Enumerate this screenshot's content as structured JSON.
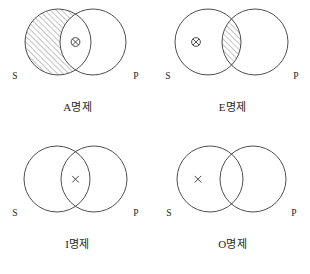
{
  "figure": {
    "title": "",
    "type": "venn-diagram-set",
    "panel_count": 4
  },
  "symbols": {
    "circled_x": "circled-x",
    "plain_x": "x",
    "hatch": "diagonal-hatch"
  },
  "panels": [
    {
      "id": "A",
      "caption": "A명제",
      "left_label": "S",
      "right_label": "P",
      "shaded_region": "s-only",
      "shading": "diagonal-hatch",
      "mark": "circled-x",
      "mark_region": "intersection"
    },
    {
      "id": "E",
      "caption": "E명제",
      "left_label": "S",
      "right_label": "P",
      "shaded_region": "intersection",
      "shading": "diagonal-hatch",
      "mark": "circled-x",
      "mark_region": "s-only"
    },
    {
      "id": "I",
      "caption": "I명제",
      "left_label": "S",
      "right_label": "P",
      "shaded_region": "none",
      "shading": "none",
      "mark": "x",
      "mark_region": "intersection"
    },
    {
      "id": "O",
      "caption": "O명제",
      "left_label": "S",
      "right_label": "P",
      "shaded_region": "none",
      "shading": "none",
      "mark": "x",
      "mark_region": "s-only"
    }
  ],
  "colors": {
    "stroke": "#3a3a3a",
    "hatch": "#555555",
    "text": "#1f1f1f",
    "background": "#ffffff"
  }
}
